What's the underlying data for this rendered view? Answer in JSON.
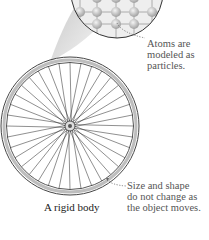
{
  "figure": {
    "caption": "A rigid body",
    "annotations": {
      "atoms": {
        "lines": [
          "Atoms are",
          "modeled as",
          "particles."
        ]
      },
      "size_shape": {
        "lines": [
          "Size and shape",
          "do not change as",
          "the object moves."
        ]
      }
    },
    "wheel": {
      "center": [
        70,
        126
      ],
      "outer_radius": 69,
      "spoke_count": 36
    },
    "colors": {
      "lines": "#333333",
      "annotation_text": "#555555",
      "leader": "#666666",
      "magnifier_fill": "#e6e6e6"
    }
  }
}
